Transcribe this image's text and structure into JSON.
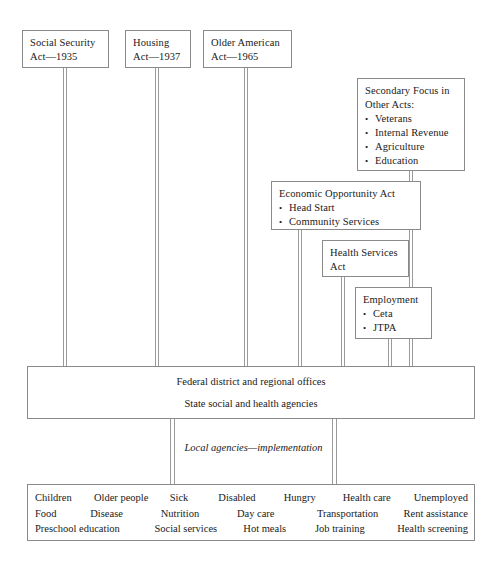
{
  "diagram": {
    "acts": [
      {
        "id": "social-security",
        "title": "Social Security\nAct—1935"
      },
      {
        "id": "housing",
        "title": "Housing\nAct—1937"
      },
      {
        "id": "older-american",
        "title": "Older American\nAct—1965"
      }
    ],
    "secondary_focus": {
      "title": "Secondary Focus in\nOther Acts:",
      "items": [
        "Veterans",
        "Internal Revenue",
        "Agriculture",
        "Education"
      ]
    },
    "economic_opportunity": {
      "title": "Economic Opportunity Act",
      "items": [
        "Head Start",
        "Community Services"
      ]
    },
    "health_services": {
      "title": "Health Services\nAct"
    },
    "employment": {
      "title": "Employment",
      "items": [
        "Ceta",
        "JTPA"
      ]
    },
    "federal_band": {
      "line1": "Federal district and regional offices",
      "line2": "State social and health agencies"
    },
    "local_agencies": {
      "label": "Local agencies—implementation"
    },
    "services": {
      "row1": [
        "Children",
        "Older people",
        "Sick",
        "Disabled",
        "Hungry",
        "Health care",
        "Unemployed"
      ],
      "row2": [
        "Food",
        "Disease",
        "Nutrition",
        "Day care",
        "Transportation",
        "Rent assistance"
      ],
      "row3": [
        "Preschool education",
        "Social services",
        "Hot meals",
        "Job training",
        "Health screening"
      ]
    },
    "colors": {
      "border": "#8a8a8a",
      "connector": "#9a9a9a",
      "text": "#1a1a1a",
      "background": "#ffffff"
    }
  }
}
